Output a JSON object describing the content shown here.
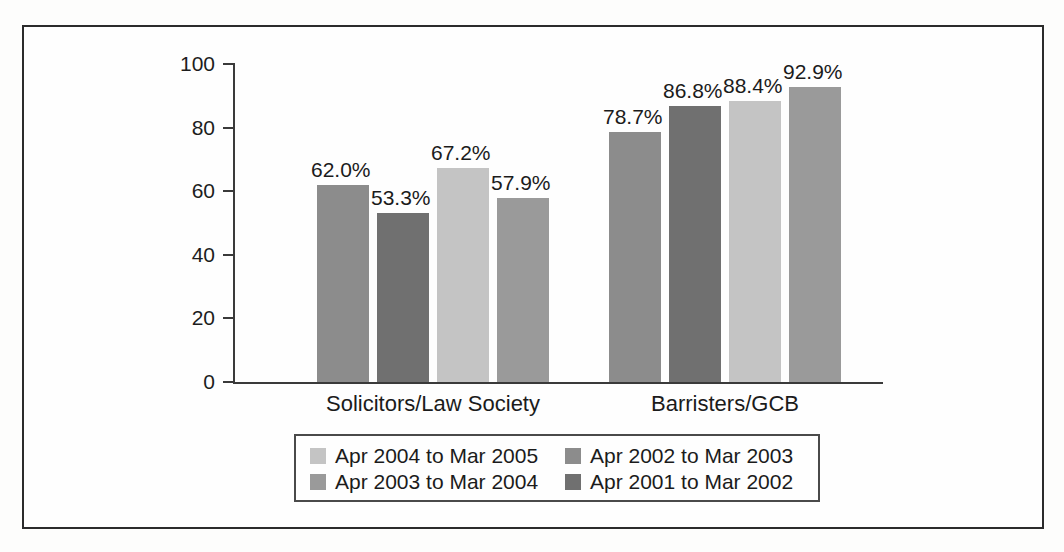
{
  "chart_data": {
    "type": "bar",
    "title": "",
    "subtitle": "",
    "xlabel": "",
    "ylabel": "",
    "ylim": [
      0,
      100
    ],
    "yticks": [
      0,
      20,
      40,
      60,
      80,
      100
    ],
    "grid": false,
    "legend_position": "bottom",
    "categories": [
      "Solicitors/Law Society",
      "Barristers/GCB"
    ],
    "series": [
      {
        "name": "Apr 2002 to Mar 2003",
        "color": "#8c8c8c",
        "values": [
          62.0,
          78.7
        ],
        "labels": [
          "62.0%",
          "78.7%"
        ]
      },
      {
        "name": "Apr 2001 to Mar 2002",
        "color": "#707070",
        "values": [
          53.3,
          86.8
        ],
        "labels": [
          "53.3%",
          "86.8%"
        ]
      },
      {
        "name": "Apr 2004 to Mar 2005",
        "color": "#c4c4c4",
        "values": [
          67.2,
          88.4
        ],
        "labels": [
          "67.2%",
          "88.4%"
        ]
      },
      {
        "name": "Apr 2003 to Mar 2004",
        "color": "#9a9a9a",
        "values": [
          57.9,
          92.9
        ],
        "labels": [
          "57.9%",
          "92.9%"
        ]
      }
    ]
  },
  "legend": {
    "entries": [
      {
        "label": "Apr 2004 to Mar 2005",
        "color": "#c4c4c4"
      },
      {
        "label": "Apr 2002 to Mar 2003",
        "color": "#8c8c8c"
      },
      {
        "label": "Apr 2003 to Mar 2004",
        "color": "#9a9a9a"
      },
      {
        "label": "Apr 2001 to Mar 2002",
        "color": "#707070"
      }
    ]
  },
  "axis": {
    "y_tick_labels": [
      "100",
      "80",
      "60",
      "40",
      "20",
      "0"
    ],
    "category_labels": [
      "Solicitors/Law Society",
      "Barristers/GCB"
    ]
  }
}
